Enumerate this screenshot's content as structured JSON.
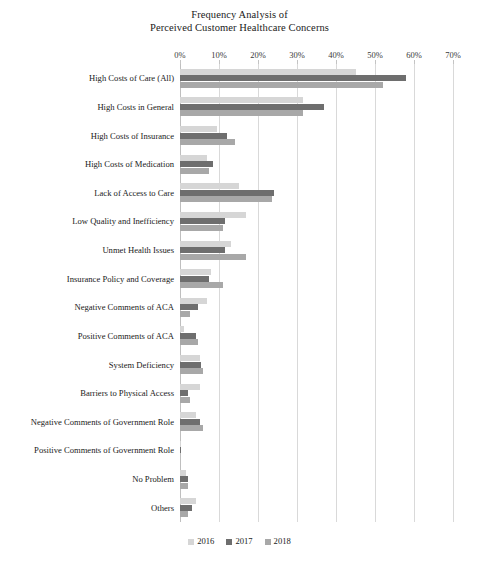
{
  "chart_data": {
    "type": "bar",
    "orientation": "horizontal",
    "title": "Frequency Analysis of Perceived Customer Healthcare Concerns",
    "title_lines": [
      "Frequency Analysis of",
      "Perceived Customer Healthcare Concerns"
    ],
    "xlabel": "",
    "ylabel": "",
    "xlim": [
      0,
      70
    ],
    "xtick_labels": [
      "0%",
      "10%",
      "20%",
      "30%",
      "40%",
      "50%",
      "60%",
      "70%"
    ],
    "xtick_values": [
      0,
      10,
      20,
      30,
      40,
      50,
      60,
      70
    ],
    "grid": true,
    "legend_position": "bottom",
    "categories": [
      "High Costs of Care (All)",
      "High Costs in General",
      "High Costs of Insurance",
      "High Costs of Medication",
      "Lack of Access to Care",
      "Low Quality and Inefficiency",
      "Unmet Health Issues",
      "Insurance Policy and Coverage",
      "Negative Comments of ACA",
      "Positive Comments of ACA",
      "System Deficiency",
      "Barriers to Physical Access",
      "Negative Comments of Government Role",
      "Positive Comments of Government Role",
      "No Problem",
      "Others"
    ],
    "series": [
      {
        "name": "2016",
        "color": "#d6d6d6",
        "values": [
          45.0,
          31.5,
          9.5,
          7.0,
          15.0,
          17.0,
          13.0,
          8.0,
          7.0,
          1.0,
          5.0,
          5.0,
          4.0,
          0.3,
          1.5,
          4.0
        ]
      },
      {
        "name": "2017",
        "color": "#6e6e6e",
        "values": [
          58.0,
          37.0,
          12.0,
          8.5,
          24.0,
          11.5,
          11.5,
          7.5,
          4.5,
          4.0,
          5.5,
          2.0,
          5.0,
          0.3,
          2.0,
          3.0
        ]
      },
      {
        "name": "2018",
        "color": "#a8a8a8",
        "values": [
          52.0,
          31.5,
          14.0,
          7.5,
          23.5,
          11.0,
          17.0,
          11.0,
          2.5,
          4.5,
          6.0,
          2.5,
          6.0,
          0.0,
          2.0,
          2.0
        ]
      }
    ]
  },
  "legend": {
    "items": [
      {
        "label": "2016",
        "class": "y2016"
      },
      {
        "label": "2017",
        "class": "y2017"
      },
      {
        "label": "2018",
        "class": "y2018"
      }
    ]
  },
  "colors": {
    "series_2016": "#d6d6d6",
    "series_2017": "#6e6e6e",
    "series_2018": "#a8a8a8",
    "gridline": "#d9d9d9",
    "text": "#1a1a1a",
    "background": "#ffffff"
  }
}
